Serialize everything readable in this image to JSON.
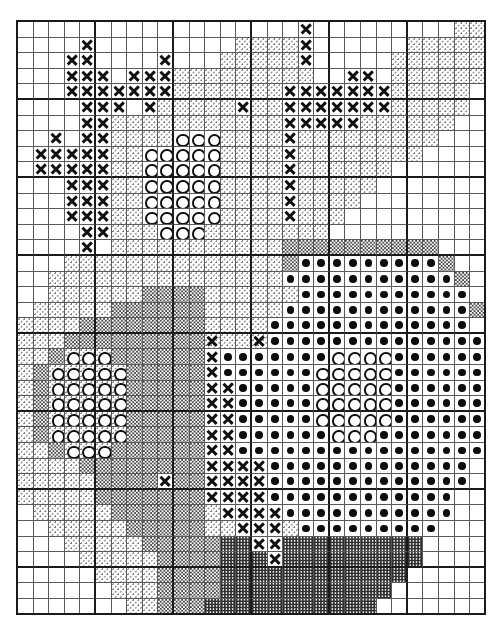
{
  "document": {
    "type": "cross-stitch-pattern-chart",
    "title": "Cross-Stitch Pattern Chart",
    "description": "Counted cross-stitch chart of a flower bouquet in a vase, rendered as a symbol grid."
  },
  "grid": {
    "columns": 30,
    "rows": 38,
    "cell_size_px": 15.6,
    "origin_x_px": 16,
    "origin_y_px": 20,
    "heavy_line_every": 5,
    "line_color": "#5a5a5a",
    "heavy_line_color": "#1a1a1a",
    "background_color": "#ffffff"
  },
  "legend": [
    {
      "key": "empty",
      "symbol": " ",
      "name": "blank",
      "label": "Empty / unstitched",
      "color": "#ffffff"
    },
    {
      "key": "light",
      "symbol": "·",
      "name": "light-stipple",
      "label": "Light stipple fill",
      "color": "#6e6e6e"
    },
    {
      "key": "medium",
      "symbol": ":",
      "name": "medium-stipple",
      "label": "Medium stipple fill",
      "color": "#4a4a4a"
    },
    {
      "key": "dense",
      "symbol": "#",
      "name": "dense-checker",
      "label": "Dense checker fill",
      "color": "#303030"
    },
    {
      "key": "cross",
      "symbol": "×",
      "name": "cross-symbol",
      "label": "Cross stitch X",
      "color": "#111111"
    },
    {
      "key": "circle",
      "symbol": "○",
      "name": "circle-symbol",
      "label": "Open circle O",
      "color": "#111111"
    },
    {
      "key": "dot",
      "symbol": "●",
      "name": "dot-symbol",
      "label": "Filled dot",
      "color": "#0d0d0d"
    }
  ],
  "chart_data": {
    "type": "heatmap",
    "xlabel": "",
    "ylabel": "",
    "columns": 30,
    "rows": 38,
    "symbol_keys": [
      "empty",
      "light",
      "medium",
      "dense",
      "cross",
      "circle",
      "dot"
    ],
    "legend_position": "none",
    "grid": true,
    "rows_encoded": [
      "..................x.........lll",
      "....x.........llllx......llllll",
      "...xx....x...lllllx.....llllll.",
      "...xxx.xxxlllllllll..xx.llllll.",
      "...xxxxxxxlllllllxxxxxxxlllll..",
      "....xxx.xlllllxllxxxxxxxlllll..",
      "....xxlllllllllllxxxxxllllll...",
      "..x.xxllllcccllllxlllllllll....",
      ".xxxxxllcccccllllxllllllll.....",
      ".xxxxxllcccccllllxllllll.......",
      "...xxxllcccccllllxlllll........",
      "...xxxllcccccllllxllll.........",
      "...xxxllcccccllllxlll..........",
      "....xxlllcccllllllll...........",
      "....x.lllllllllllmmmmmmmmmm....",
      "...llllllllllllllmOOOOOOOOOm...",
      "..lllllllllllllllOOOOOOOOOOOm..",
      "..llllllmmmmllllllOOOOOOOOOOO..",
      ".lllllmmmmmmlllllOOOOOOOOOOOOm.",
      "llllmmmmmmmmllllOOOOOOOOOOOOO..",
      "lllmmmmmmmmmXllXOOOOOOOOOOOOOO.",
      "llmCCCmmmmmmxOOOOOOOccccOOOOOOO",
      "lmCCCCCmmmmmxOOOOOOcccccOOOOOOO",
      "lmCCCCCmmmmmxxOOOOOcccccOOOOOOO",
      "lmCCCCCmmmmmxxOOOOOcccccOOOOOOO",
      "lmCCCCCmmmmmxxOOOOOcccccOOOOOOO",
      "lmCCCCCmmmmmxxOOOOOOcccOOOOOOOO",
      "llmCCCmmmmmmxxOOOOOOOOOOOOOOOO.",
      "llllmmmmmmmmxxxxOOOOOOOOOOOOO..",
      "lllllmmmmxmmxxxxOOOOOOOOOOOOO..",
      "lllllmmmmmmmxxxxOOOOOOOOOOOO...",
      ".lllllmmmmmmlxxxxOOOOOOOOOOO...",
      "..lllllmmmmmllxxxlOOOOOOOOO....",
      "...lllllmmmmmddxxddddddddd.....",
      "....lllllmmmmdddxddddddddd.....",
      ".....llllmmmmdddddddddddd......",
      "......lllmmmmddddddddddd.......",
      ".......llmmmddddddddddd........"
    ]
  }
}
